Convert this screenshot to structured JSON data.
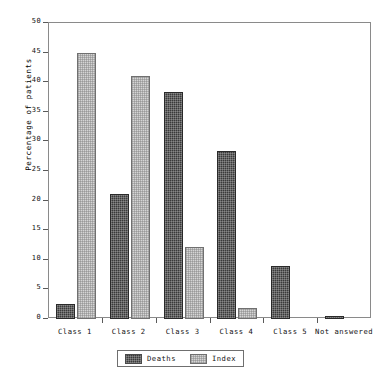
{
  "chart_data": {
    "type": "bar",
    "title": "",
    "subtitle": "",
    "xlabel": "",
    "ylabel": "Percentage of patients",
    "categories": [
      "Class 1",
      "Class 2",
      "Class 3",
      "Class 4",
      "Class 5",
      "Not answered"
    ],
    "series": [
      {
        "name": "Deaths",
        "color": "#3a3a3a",
        "values": [
          2.5,
          21.1,
          38.4,
          28.4,
          9.0,
          0.5
        ]
      },
      {
        "name": "Index",
        "color": "#d5d5d5",
        "values": [
          45.0,
          41.0,
          12.2,
          1.8,
          0.0,
          0.0
        ]
      }
    ],
    "ylim": [
      0,
      50
    ],
    "yticks": [
      0,
      5,
      10,
      15,
      20,
      25,
      30,
      35,
      40,
      45,
      50
    ],
    "ytick_labels": [
      "0",
      "5",
      "10",
      "15",
      "20",
      "25",
      "30",
      "35",
      "40",
      "45",
      "50"
    ],
    "grid": false,
    "legend_position": "bottom"
  },
  "legend": {
    "entries": [
      {
        "label": "Deaths"
      },
      {
        "label": "Index"
      }
    ]
  },
  "axis": {
    "y_title": "Percentage of patients"
  }
}
